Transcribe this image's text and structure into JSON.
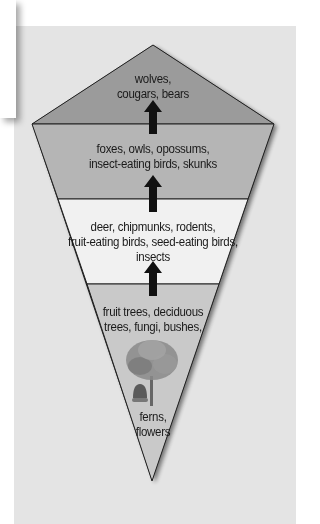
{
  "diagram": {
    "type": "food-web-pyramid",
    "tiers": [
      {
        "id": "top",
        "label": "wolves,\ncougars, bears",
        "lines": [
          "wolves,",
          "cougars, bears"
        ],
        "color": "#9b9b9b"
      },
      {
        "id": "secondary",
        "label": "foxes, owls, opossums, insect-eating birds, skunks",
        "lines": [
          "foxes, owls, opossums,",
          "insect-eating birds, skunks"
        ],
        "color": "#b5b5b5"
      },
      {
        "id": "primary",
        "label": "deer, chipmunks, rodents, fruit-eating birds, seed-eating birds, insects",
        "lines": [
          "deer, chipmunks, rodents,",
          "fruit-eating birds, seed-eating birds,",
          "insects"
        ],
        "color": "#f1f1f1"
      },
      {
        "id": "producers",
        "label": "fruit trees, deciduous trees, fungi, bushes, ferns, flowers",
        "lines": [
          "fruit trees, deciduous",
          "trees, fungi, bushes,"
        ],
        "lines_bottom": [
          "ferns,",
          "flowers"
        ],
        "color": "#c9c9c9"
      }
    ],
    "icons": [
      "up-arrow-icon",
      "up-arrow-icon",
      "up-arrow-icon",
      "tree-icon",
      "acorn-icon"
    ],
    "background_color": "#e4e4e4"
  }
}
